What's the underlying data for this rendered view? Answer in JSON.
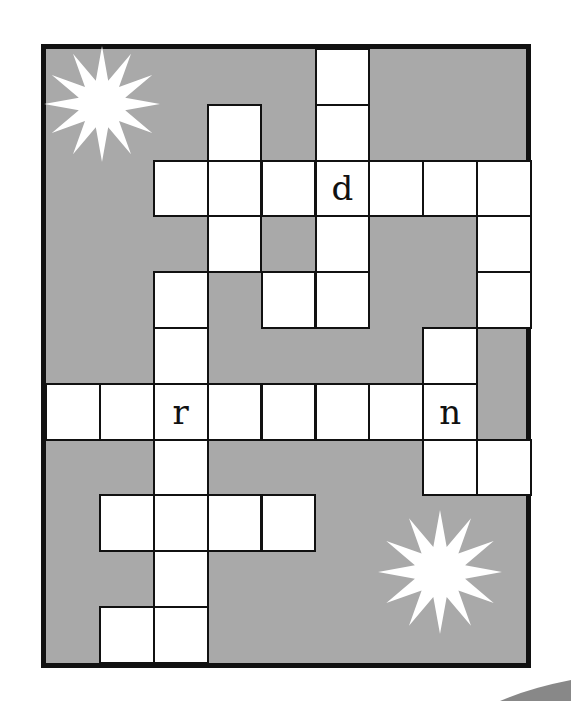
{
  "puzzle": {
    "type": "crossword",
    "columns": 9,
    "rows": 11,
    "colors": {
      "block": "#a9a9a9",
      "cell": "#ffffff",
      "border": "#111111"
    },
    "cells": [
      {
        "r": 0,
        "c": 5,
        "letter": ""
      },
      {
        "r": 1,
        "c": 3,
        "letter": ""
      },
      {
        "r": 1,
        "c": 5,
        "letter": ""
      },
      {
        "r": 2,
        "c": 2,
        "letter": ""
      },
      {
        "r": 2,
        "c": 3,
        "letter": ""
      },
      {
        "r": 2,
        "c": 4,
        "letter": ""
      },
      {
        "r": 2,
        "c": 5,
        "letter": "d"
      },
      {
        "r": 2,
        "c": 6,
        "letter": ""
      },
      {
        "r": 2,
        "c": 7,
        "letter": ""
      },
      {
        "r": 2,
        "c": 8,
        "letter": ""
      },
      {
        "r": 3,
        "c": 3,
        "letter": ""
      },
      {
        "r": 3,
        "c": 5,
        "letter": ""
      },
      {
        "r": 3,
        "c": 8,
        "letter": ""
      },
      {
        "r": 4,
        "c": 2,
        "letter": ""
      },
      {
        "r": 4,
        "c": 4,
        "letter": ""
      },
      {
        "r": 4,
        "c": 5,
        "letter": ""
      },
      {
        "r": 4,
        "c": 8,
        "letter": ""
      },
      {
        "r": 5,
        "c": 2,
        "letter": ""
      },
      {
        "r": 5,
        "c": 7,
        "letter": ""
      },
      {
        "r": 6,
        "c": 0,
        "letter": ""
      },
      {
        "r": 6,
        "c": 1,
        "letter": ""
      },
      {
        "r": 6,
        "c": 2,
        "letter": "r"
      },
      {
        "r": 6,
        "c": 3,
        "letter": ""
      },
      {
        "r": 6,
        "c": 4,
        "letter": ""
      },
      {
        "r": 6,
        "c": 5,
        "letter": ""
      },
      {
        "r": 6,
        "c": 6,
        "letter": ""
      },
      {
        "r": 6,
        "c": 7,
        "letter": "n"
      },
      {
        "r": 7,
        "c": 2,
        "letter": ""
      },
      {
        "r": 7,
        "c": 7,
        "letter": ""
      },
      {
        "r": 7,
        "c": 8,
        "letter": ""
      },
      {
        "r": 8,
        "c": 1,
        "letter": ""
      },
      {
        "r": 8,
        "c": 2,
        "letter": ""
      },
      {
        "r": 8,
        "c": 3,
        "letter": ""
      },
      {
        "r": 8,
        "c": 4,
        "letter": ""
      },
      {
        "r": 9,
        "c": 2,
        "letter": ""
      },
      {
        "r": 10,
        "c": 1,
        "letter": ""
      },
      {
        "r": 10,
        "c": 2,
        "letter": ""
      }
    ],
    "decorations": [
      {
        "name": "starburst-icon",
        "cx": 102,
        "cy": 104,
        "r_outer": 58,
        "r_inner": 24,
        "points": 12
      },
      {
        "name": "starburst-icon",
        "cx": 440,
        "cy": 572,
        "r_outer": 62,
        "r_inner": 26,
        "points": 12
      }
    ]
  }
}
